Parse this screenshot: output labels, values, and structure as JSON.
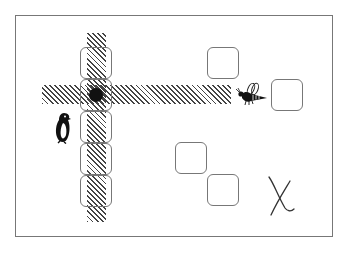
{
  "board": {
    "frame": {
      "x": 15,
      "y": 15,
      "w": 318,
      "h": 222,
      "color": "#777777"
    },
    "hatch_color": "#444444",
    "hatches": [
      {
        "name": "vertical-beam",
        "x": 87,
        "y": 33,
        "w": 19,
        "h": 189
      },
      {
        "name": "horizontal-beam",
        "x": 42,
        "y": 85,
        "w": 189,
        "h": 19
      }
    ],
    "cells": [
      {
        "name": "cell-col-1",
        "x": 80,
        "y": 47
      },
      {
        "name": "cell-col-2",
        "x": 80,
        "y": 79
      },
      {
        "name": "cell-col-3",
        "x": 80,
        "y": 111
      },
      {
        "name": "cell-col-4",
        "x": 80,
        "y": 143
      },
      {
        "name": "cell-col-5",
        "x": 80,
        "y": 175
      },
      {
        "name": "cell-top-right",
        "x": 207,
        "y": 47
      },
      {
        "name": "cell-right",
        "x": 271,
        "y": 79
      },
      {
        "name": "cell-lower-a",
        "x": 175,
        "y": 142
      },
      {
        "name": "cell-lower-b",
        "x": 207,
        "y": 174
      }
    ],
    "dot": {
      "x": 89,
      "y": 88,
      "color": "#111111"
    },
    "penguin": {
      "icon": "penguin-icon",
      "x": 54,
      "y": 112
    },
    "bee": {
      "icon": "bee-icon",
      "x": 236,
      "y": 82
    },
    "target": {
      "icon": "x-mark-icon",
      "label": "X",
      "x": 265,
      "y": 174
    }
  }
}
